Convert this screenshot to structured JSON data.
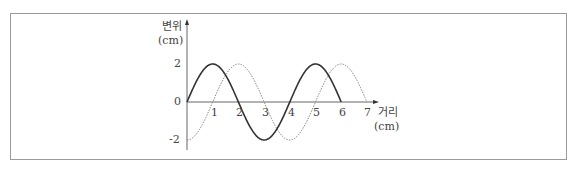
{
  "chart_data": {
    "type": "line",
    "title": "",
    "xlabel": "거리",
    "xlabel_unit": "(cm)",
    "ylabel": "변위",
    "ylabel_unit": "(cm)",
    "x_ticks": [
      "1",
      "2",
      "3",
      "4",
      "5",
      "6",
      "7"
    ],
    "y_ticks": [
      "2",
      "0",
      "-2"
    ],
    "xlim": [
      0,
      7
    ],
    "ylim": [
      -2,
      2
    ],
    "grid": false,
    "legend": null,
    "series": [
      {
        "name": "solid wave",
        "style": "solid",
        "color": "#333333",
        "x": [
          0,
          0.5,
          1,
          1.5,
          2,
          2.5,
          3,
          3.5,
          4,
          4.5,
          5,
          5.5,
          6
        ],
        "values": [
          0,
          1.41,
          2,
          1.41,
          0,
          -1.41,
          -2,
          -1.41,
          0,
          1.41,
          2,
          1.41,
          0
        ]
      },
      {
        "name": "dotted wave",
        "style": "dotted",
        "color": "#888888",
        "x": [
          0,
          0.5,
          1,
          1.5,
          2,
          2.5,
          3,
          3.5,
          4,
          4.5,
          5,
          5.5,
          6,
          6.5,
          7
        ],
        "values": [
          -2,
          -1.41,
          0,
          1.41,
          2,
          1.41,
          0,
          -1.41,
          -2,
          -1.41,
          0,
          1.41,
          2,
          1.41,
          0
        ]
      }
    ]
  },
  "labels": {
    "y_axis_name": "변위",
    "y_axis_unit": "(cm)",
    "x_axis_name": "거리",
    "x_axis_unit": "(cm)",
    "origin": "0",
    "y_top": "2",
    "y_bottom": "-2",
    "x1": "1",
    "x2": "2",
    "x3": "3",
    "x4": "4",
    "x5": "5",
    "x6": "6",
    "x7": "7"
  }
}
